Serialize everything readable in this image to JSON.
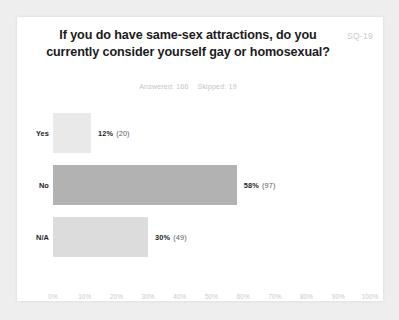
{
  "page": {
    "background_color": "#eeeeee",
    "card_color": "#ffffff"
  },
  "header": {
    "title": "If you do have same-sex attractions, do you currently consider yourself gay or homosexual?",
    "question_code": "SQ-19",
    "answered_label": "Answered: 166",
    "skipped_label": "Skipped: 19"
  },
  "chart_data": {
    "type": "bar",
    "orientation": "horizontal",
    "title": "If you do have same-sex attractions, do you currently consider yourself gay or homosexual?",
    "xlabel": "",
    "ylabel": "",
    "xlim": [
      0,
      100
    ],
    "grid": false,
    "legend": "none",
    "categories": [
      "Yes",
      "No",
      "N/A"
    ],
    "values": [
      12,
      58,
      30
    ],
    "counts": [
      20,
      97,
      49
    ],
    "value_labels": [
      "12%",
      "58%",
      "30%"
    ],
    "count_labels": [
      "(20)",
      "(97)",
      "(49)"
    ],
    "bar_colors": [
      "#e9e9e9",
      "#b2b2b2",
      "#dcdcdc"
    ],
    "tick_labels": [
      "0%",
      "10%",
      "20%",
      "30%",
      "40%",
      "50%",
      "60%",
      "70%",
      "80%",
      "90%",
      "100%"
    ],
    "tick_values": [
      0,
      10,
      20,
      30,
      40,
      50,
      60,
      70,
      80,
      90,
      100
    ],
    "total_answered": 166,
    "total_skipped": 19
  }
}
